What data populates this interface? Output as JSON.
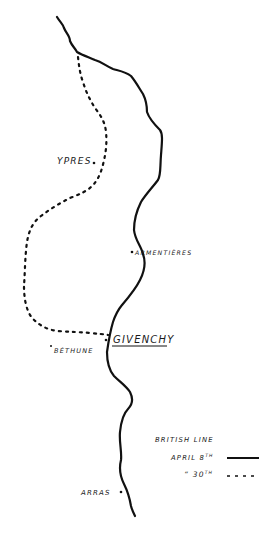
{
  "map": {
    "title": "British Line",
    "towns": [
      {
        "id": "ypres",
        "name": "YPRES"
      },
      {
        "id": "armentieres",
        "name": "ARMENTIÈRES"
      },
      {
        "id": "givenchy",
        "name": "GIVENCHY",
        "underlined": true
      },
      {
        "id": "bethune",
        "name": "BÉTHUNE"
      },
      {
        "id": "arras",
        "name": "ARRAS"
      }
    ],
    "lines": [
      {
        "id": "april-8",
        "label": "April 8th",
        "style": "solid"
      },
      {
        "id": "april-30",
        "label": "April 30th",
        "style": "dashed"
      }
    ]
  },
  "legend": {
    "title": "BRITISH LINE",
    "entries": [
      {
        "label": "APRIL 8",
        "suffix": "TH",
        "style": "solid"
      },
      {
        "label": "“  30",
        "suffix": "TH",
        "style": "dashed"
      }
    ]
  }
}
